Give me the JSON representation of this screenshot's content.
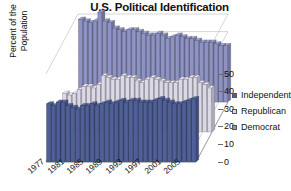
{
  "chart_data": {
    "type": "bar",
    "title": "U.S. Political Identification",
    "xlabel": "",
    "ylabel_line1": "Percent of the",
    "ylabel_line2": "Population",
    "ylim": [
      0,
      50
    ],
    "yticks": [
      50,
      40,
      30,
      20,
      10,
      0
    ],
    "grid": true,
    "legend_position": "right",
    "categories": [
      "1977",
      "1978",
      "1979",
      "1980",
      "1981",
      "1982",
      "1983",
      "1984",
      "1985",
      "1986",
      "1987",
      "1988",
      "1989",
      "1990",
      "1991",
      "1992",
      "1993",
      "1994",
      "1995",
      "1996",
      "1997",
      "1998",
      "1999",
      "2000",
      "2001",
      "2002",
      "2003",
      "2004",
      "2005",
      "2006",
      "2007"
    ],
    "xtick_labels": [
      "1977",
      "1981",
      "1985",
      "1989",
      "1993",
      "1997",
      "2001",
      "2005"
    ],
    "xtick_indices": [
      0,
      4,
      8,
      12,
      16,
      20,
      24,
      28
    ],
    "series": [
      {
        "name": "Independent",
        "color": "#4f5f97",
        "values": [
          33,
          32,
          34,
          34,
          32,
          31,
          30,
          32,
          32,
          33,
          32,
          33,
          34,
          33,
          34,
          35,
          34,
          35,
          35,
          34,
          34,
          34,
          35,
          36,
          35,
          34,
          33,
          33,
          34,
          35,
          36
        ]
      },
      {
        "name": "Republican",
        "color": "#dcd9e6",
        "values": [
          22,
          21,
          22,
          24,
          26,
          26,
          25,
          27,
          32,
          31,
          30,
          30,
          32,
          31,
          31,
          29,
          28,
          30,
          31,
          30,
          29,
          28,
          28,
          28,
          30,
          30,
          31,
          31,
          28,
          27,
          25
        ]
      },
      {
        "name": "Democrat",
        "color": "#8e93c4",
        "values": [
          47,
          46,
          45,
          46,
          51,
          46,
          45,
          42,
          41,
          40,
          41,
          41,
          40,
          39,
          38,
          38,
          39,
          38,
          36,
          37,
          38,
          37,
          36,
          36,
          35,
          34,
          34,
          34,
          33,
          32,
          32
        ]
      }
    ]
  },
  "legend": {
    "items": [
      {
        "label": "Independent",
        "color": "#4f5f97"
      },
      {
        "label": "Republican",
        "color": "#dcd9e6"
      },
      {
        "label": "Democrat",
        "color": "#8e93c4"
      }
    ]
  }
}
